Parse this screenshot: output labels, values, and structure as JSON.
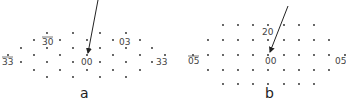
{
  "figure": {
    "panels": [
      {
        "caption": "a",
        "labels": [
          {
            "text": "30",
            "overbar": true,
            "x": 42,
            "y": 45
          },
          {
            "text": "03",
            "overbar": false,
            "x": 119,
            "y": 45
          },
          {
            "text": "33",
            "overbar": true,
            "x": 2,
            "y": 65
          },
          {
            "text": "00",
            "overbar": false,
            "x": 81,
            "y": 65
          },
          {
            "text": "33",
            "overbar": false,
            "x": 156,
            "y": 65
          }
        ],
        "dots": [
          [
            47,
            33
          ],
          [
            73,
            33
          ],
          [
            100,
            33
          ],
          [
            126,
            33
          ],
          [
            34,
            40
          ],
          [
            60,
            40
          ],
          [
            87,
            40
          ],
          [
            113,
            40
          ],
          [
            140,
            40
          ],
          [
            21,
            48
          ],
          [
            47,
            48
          ],
          [
            73,
            48
          ],
          [
            100,
            48
          ],
          [
            126,
            48
          ],
          [
            152,
            48
          ],
          [
            8,
            55
          ],
          [
            34,
            55
          ],
          [
            60,
            55
          ],
          [
            87,
            55
          ],
          [
            113,
            55
          ],
          [
            140,
            55
          ],
          [
            165,
            55
          ],
          [
            21,
            62
          ],
          [
            47,
            62
          ],
          [
            73,
            62
          ],
          [
            100,
            62
          ],
          [
            126,
            62
          ],
          [
            152,
            62
          ],
          [
            34,
            70
          ],
          [
            60,
            70
          ],
          [
            87,
            70
          ],
          [
            113,
            70
          ],
          [
            140,
            70
          ],
          [
            47,
            77
          ],
          [
            73,
            77
          ],
          [
            100,
            77
          ],
          [
            126,
            77
          ]
        ],
        "arrow": {
          "x1": 98,
          "y1": 0,
          "x2": 88,
          "y2": 53
        }
      },
      {
        "caption": "b",
        "labels": [
          {
            "text": "20",
            "overbar": false,
            "x": 262,
            "y": 35
          },
          {
            "text": "05",
            "overbar": true,
            "x": 188,
            "y": 64
          },
          {
            "text": "00",
            "overbar": false,
            "x": 265,
            "y": 64
          },
          {
            "text": "05",
            "overbar": false,
            "x": 335,
            "y": 64
          }
        ],
        "dots": [
          [
            223,
            25
          ],
          [
            238,
            25
          ],
          [
            253,
            25
          ],
          [
            268,
            25
          ],
          [
            284,
            25
          ],
          [
            299,
            25
          ],
          [
            314,
            25
          ],
          [
            208,
            40
          ],
          [
            223,
            40
          ],
          [
            238,
            40
          ],
          [
            253,
            40
          ],
          [
            268,
            40
          ],
          [
            284,
            40
          ],
          [
            299,
            40
          ],
          [
            314,
            40
          ],
          [
            329,
            40
          ],
          [
            193,
            55
          ],
          [
            208,
            55
          ],
          [
            223,
            55
          ],
          [
            238,
            55
          ],
          [
            253,
            55
          ],
          [
            268,
            55
          ],
          [
            284,
            55
          ],
          [
            299,
            55
          ],
          [
            314,
            55
          ],
          [
            329,
            55
          ],
          [
            345,
            55
          ],
          [
            208,
            70
          ],
          [
            223,
            70
          ],
          [
            238,
            70
          ],
          [
            253,
            70
          ],
          [
            268,
            70
          ],
          [
            284,
            70
          ],
          [
            299,
            70
          ],
          [
            314,
            70
          ],
          [
            329,
            70
          ],
          [
            223,
            84
          ],
          [
            238,
            84
          ],
          [
            253,
            84
          ],
          [
            268,
            84
          ],
          [
            284,
            84
          ],
          [
            299,
            84
          ],
          [
            314,
            84
          ]
        ],
        "arrow": {
          "x1": 288,
          "y1": 6,
          "x2": 270,
          "y2": 52
        }
      }
    ]
  }
}
